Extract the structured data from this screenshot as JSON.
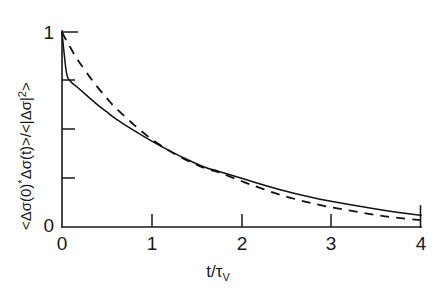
{
  "chart_data": {
    "type": "line",
    "title": "",
    "subtitle": "",
    "xlabel": "t/τ_V",
    "ylabel": "<Δσ(0)*Δσ(t)>/<|Δσ|²>",
    "xlim": [
      0,
      4
    ],
    "ylim": [
      0,
      1
    ],
    "grid": false,
    "legend": "none",
    "x_ticks": [
      0,
      1,
      2,
      3,
      4
    ],
    "x_tick_labels": [
      "0",
      "1",
      "2",
      "3",
      "4"
    ],
    "y_ticks": [
      0,
      0.25,
      0.5,
      0.75,
      1
    ],
    "y_tick_labels": [
      "0",
      "",
      "",
      "",
      "1"
    ],
    "x": [
      0,
      0.05,
      0.1,
      0.15,
      0.2,
      0.3,
      0.4,
      0.5,
      0.6,
      0.8,
      1.0,
      1.2,
      1.4,
      1.6,
      1.75,
      2.0,
      2.4,
      2.8,
      3.2,
      3.6,
      4.0
    ],
    "series": [
      {
        "name": "solid-curve",
        "style": "solid",
        "color": "#111111",
        "values": [
          1.0,
          0.79,
          0.745,
          0.725,
          0.705,
          0.665,
          0.625,
          0.59,
          0.555,
          0.495,
          0.44,
          0.39,
          0.345,
          0.305,
          0.285,
          0.25,
          0.195,
          0.15,
          0.115,
          0.085,
          0.06
        ]
      },
      {
        "name": "dashed-curve",
        "style": "dashed",
        "color": "#111111",
        "values": [
          1.0,
          0.955,
          0.915,
          0.875,
          0.84,
          0.775,
          0.715,
          0.66,
          0.61,
          0.525,
          0.45,
          0.39,
          0.34,
          0.3,
          0.28,
          0.235,
          0.17,
          0.12,
          0.085,
          0.055,
          0.035
        ]
      }
    ],
    "annotations": []
  },
  "ylabel_parts": {
    "open": "<Δσ(0)",
    "star": "*",
    "mid": "Δσ(t)>/<|Δσ|",
    "exp": "2",
    "close": ">"
  },
  "xlabel_parts": {
    "base": "t/τ",
    "sub": "V"
  },
  "tick_labels": {
    "x0": "0",
    "x1": "1",
    "x2": "2",
    "x3": "3",
    "x4": "4",
    "y0": "0",
    "y1": "1"
  }
}
